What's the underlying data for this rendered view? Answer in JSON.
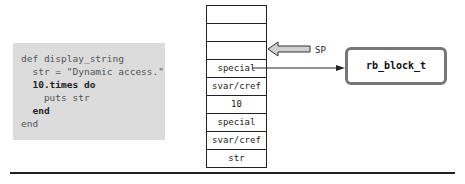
{
  "code": {
    "lines": [
      {
        "indent": "",
        "text": "def display_string",
        "bold": ""
      },
      {
        "indent": "  ",
        "text": "str = \"Dynamic access.\"",
        "bold": ""
      },
      {
        "indent": "  ",
        "text": "10.times ",
        "bold": "do"
      },
      {
        "indent": "    ",
        "text": "puts str",
        "bold": ""
      },
      {
        "indent": "  ",
        "text": "",
        "bold": "end"
      },
      {
        "indent": "",
        "text": "end",
        "bold": ""
      }
    ]
  },
  "stack": {
    "cells": [
      "",
      "",
      "",
      "special",
      "svar/cref",
      "10",
      "special",
      "svar/cref",
      "str"
    ]
  },
  "pointer": {
    "label": "SP"
  },
  "target": {
    "label": "rb_block_t"
  },
  "colors": {
    "code_bg": "#dcdcdc",
    "block_border": "#777777",
    "sp_arrow_fill": "#d0d0d0"
  }
}
